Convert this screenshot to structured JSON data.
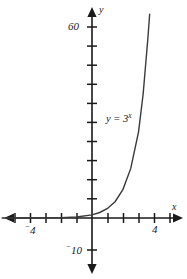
{
  "chart_data": {
    "type": "line",
    "title": "",
    "xlabel": "x",
    "ylabel": "y",
    "function_label": "y = 3",
    "function_exponent": "x",
    "function_expression": "y = 3^x",
    "xlim": [
      -5.8,
      5.2
    ],
    "ylim": [
      -13,
      67
    ],
    "x_tick_step": 1,
    "y_tick_step": 10,
    "grid": false,
    "legend": null,
    "axis_color": "#1a1a1a",
    "curve_color": "#3a3a3a",
    "background_color": "#ffffff",
    "x_tick_labels": [
      {
        "value": -4,
        "text": "4",
        "negative": true
      },
      {
        "value": 4,
        "text": "4",
        "negative": false
      }
    ],
    "y_tick_labels": [
      {
        "value": 60,
        "text": "60",
        "negative": false
      },
      {
        "value": -10,
        "text": "10",
        "negative": true
      }
    ],
    "x_ticks": [
      -5,
      -4,
      -3,
      -2,
      -1,
      1,
      2,
      3,
      4,
      5
    ],
    "y_ticks": [
      10,
      20,
      30,
      40,
      50,
      60,
      -10
    ],
    "x": [
      -5.8,
      -5,
      -4,
      -3,
      -2,
      -1,
      0,
      0.5,
      1,
      1.5,
      2,
      2.5,
      3,
      3.3,
      3.6,
      3.72
    ],
    "y": [
      0.004,
      0.004,
      0.012,
      0.037,
      0.111,
      0.333,
      1,
      1.732,
      3,
      5.196,
      9,
      15.588,
      27,
      38.94,
      56.17,
      64.0
    ],
    "series": [
      {
        "name": "y = 3^x",
        "values": [
          0.004,
          0.004,
          0.012,
          0.037,
          0.111,
          0.333,
          1,
          1.732,
          3,
          5.196,
          9,
          15.588,
          27,
          38.94,
          56.17,
          64.0
        ]
      }
    ],
    "annotations": [
      {
        "text": "y = 3^x",
        "x": 2.1,
        "y": 32
      }
    ]
  },
  "axes": {
    "x_axis_name": "x",
    "y_axis_name": "y"
  },
  "labels": {
    "y_top": "60",
    "y_bottom": "10",
    "x_left": "4",
    "x_right": "4",
    "curve_base": "y = 3",
    "curve_exponent": "x"
  }
}
